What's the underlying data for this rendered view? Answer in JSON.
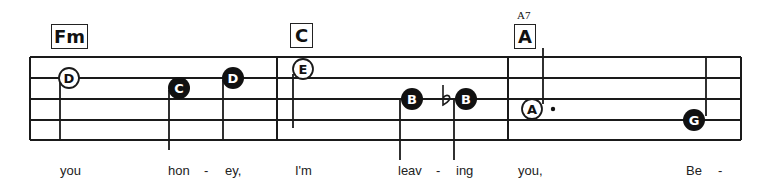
{
  "staff": {
    "left": 30,
    "right": 741,
    "lines_y": [
      57,
      78,
      99,
      120,
      140
    ],
    "barlines_x": [
      30,
      277,
      508,
      741
    ],
    "line_color": "#1a1a1a"
  },
  "chords": [
    {
      "label": "Fm",
      "x": 51,
      "y": 24,
      "w": 37,
      "h": 25
    },
    {
      "label": "C",
      "x": 290,
      "y": 23,
      "w": 23,
      "h": 25
    },
    {
      "label": "A",
      "x": 514,
      "y": 24,
      "w": 22,
      "h": 25,
      "superscript": "A7"
    }
  ],
  "notes": [
    {
      "letter": "D",
      "style": "open",
      "cx": 69,
      "cy": 78,
      "stem_x": 60,
      "stem_y1": 78,
      "stem_y2": 140
    },
    {
      "letter": "C",
      "style": "filled",
      "cx": 179,
      "cy": 88,
      "stem_x": 169,
      "stem_y1": 90,
      "stem_y2": 150
    },
    {
      "letter": "D",
      "style": "filled",
      "cx": 233,
      "cy": 78,
      "stem_x": 223,
      "stem_y1": 80,
      "stem_y2": 140
    },
    {
      "letter": "E",
      "style": "open",
      "cx": 303,
      "cy": 69,
      "stem_x": 293,
      "stem_y1": 74,
      "stem_y2": 128
    },
    {
      "letter": "B",
      "style": "filled",
      "cx": 412,
      "cy": 99,
      "stem_x": 400,
      "stem_y1": 100,
      "stem_y2": 160
    },
    {
      "letter": "B",
      "style": "filled",
      "cx": 466,
      "cy": 99,
      "stem_x": 454,
      "stem_y1": 100,
      "stem_y2": 160,
      "accidental": "flat"
    },
    {
      "letter": "A",
      "style": "open",
      "cx": 532,
      "cy": 109,
      "stem_x": 543,
      "stem_y1": 48,
      "stem_y2": 104,
      "dotted": true
    },
    {
      "letter": "G",
      "style": "filled",
      "cx": 694,
      "cy": 120,
      "stem_x": 706,
      "stem_y1": 58,
      "stem_y2": 116
    }
  ],
  "lyrics": [
    {
      "text": "you",
      "x": 60
    },
    {
      "text": "hon",
      "x": 168
    },
    {
      "text": "-",
      "x": 204
    },
    {
      "text": "ey,",
      "x": 225
    },
    {
      "text": "I'm",
      "x": 295
    },
    {
      "text": "leav",
      "x": 398
    },
    {
      "text": "-",
      "x": 436
    },
    {
      "text": "ing",
      "x": 456
    },
    {
      "text": "you,",
      "x": 518
    },
    {
      "text": "Be",
      "x": 686
    },
    {
      "text": "-",
      "x": 718
    }
  ]
}
